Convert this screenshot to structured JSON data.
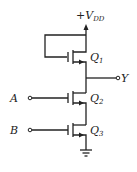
{
  "diagram": {
    "type": "nmos-logic-gate-schematic",
    "supply": {
      "label": "+V",
      "subscript": "DD"
    },
    "output": {
      "label": "Y"
    },
    "inputs": [
      {
        "label": "A",
        "drives": "Q2"
      },
      {
        "label": "B",
        "drives": "Q3"
      }
    ],
    "transistors": [
      {
        "name": "Q",
        "subscript": "1",
        "role": "load (gate tied to drain / VDD)"
      },
      {
        "name": "Q",
        "subscript": "2",
        "role": "driver, gate = A"
      },
      {
        "name": "Q",
        "subscript": "3",
        "role": "driver, gate = B"
      }
    ],
    "ground": {
      "symbol": "ground"
    }
  }
}
